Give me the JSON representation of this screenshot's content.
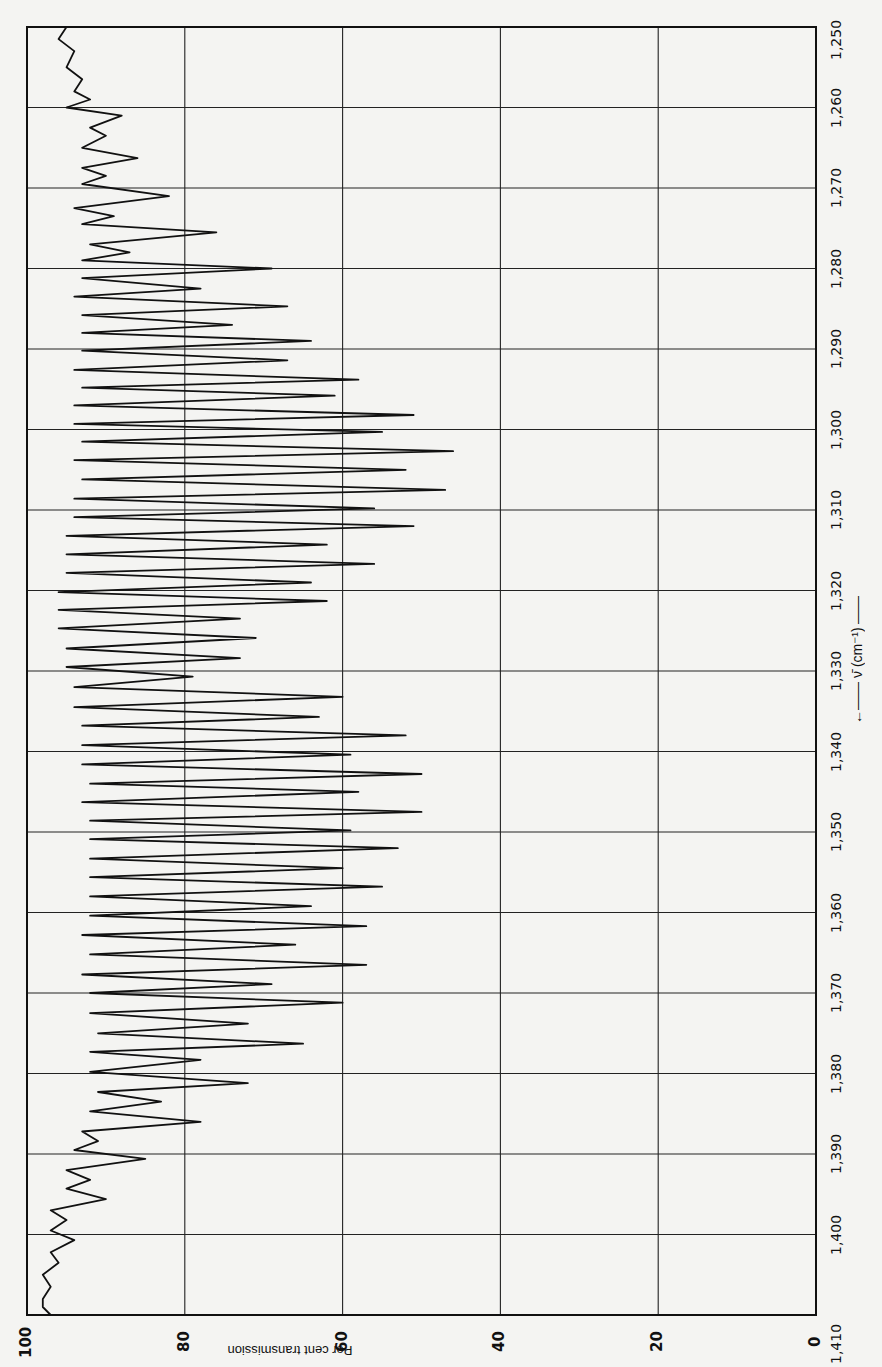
{
  "chart_data": {
    "type": "line",
    "title": "",
    "orientation": "rotated 90° (wavenumber runs vertically, transmission horizontally)",
    "xlabel": "ν̄ (cm⁻¹)",
    "ylabel": "Per cent transmission",
    "x_axis": {
      "label": "ν̄ (cm⁻¹)",
      "range": [
        1410,
        1250
      ],
      "ticks": [
        "1,410",
        "1,400",
        "1,390",
        "1,380",
        "1,370",
        "1,360",
        "1,350",
        "1,340",
        "1,330",
        "1,320",
        "1,310",
        "1,300",
        "1,290",
        "1,280",
        "1,270",
        "1,260",
        "1,250"
      ],
      "direction_arrow": "←"
    },
    "y_axis": {
      "label": "Per cent transmission",
      "range": [
        0,
        100
      ],
      "ticks": [
        "100",
        "80",
        "60",
        "40",
        "20",
        "0"
      ]
    },
    "grid": true,
    "legend": null,
    "series": [
      {
        "name": "IR absorption spectrum (rotational-vibrational band)",
        "points": [
          [
            1250,
            95
          ],
          [
            1251.5,
            96
          ],
          [
            1253,
            94
          ],
          [
            1255,
            95
          ],
          [
            1256.5,
            93
          ],
          [
            1258,
            94
          ],
          [
            1259,
            92
          ],
          [
            1260,
            95
          ],
          [
            1261,
            88
          ],
          [
            1262.5,
            92
          ],
          [
            1263.5,
            90
          ],
          [
            1265,
            93
          ],
          [
            1266.3,
            86
          ],
          [
            1267.5,
            93
          ],
          [
            1268.5,
            90
          ],
          [
            1269.5,
            93
          ],
          [
            1271,
            82
          ],
          [
            1272.5,
            94
          ],
          [
            1273.5,
            89
          ],
          [
            1274.5,
            93
          ],
          [
            1275.5,
            76
          ],
          [
            1277,
            92
          ],
          [
            1278,
            87
          ],
          [
            1279,
            93
          ],
          [
            1280,
            69
          ],
          [
            1281.2,
            93
          ],
          [
            1282.5,
            78
          ],
          [
            1283.5,
            94
          ],
          [
            1284.7,
            67
          ],
          [
            1285.8,
            93
          ],
          [
            1287,
            74
          ],
          [
            1288,
            93
          ],
          [
            1289,
            64
          ],
          [
            1290.2,
            93
          ],
          [
            1291.4,
            67
          ],
          [
            1292.6,
            94
          ],
          [
            1293.8,
            58
          ],
          [
            1294.8,
            93
          ],
          [
            1295.8,
            61
          ],
          [
            1297,
            94
          ],
          [
            1298.2,
            51
          ],
          [
            1299.3,
            94
          ],
          [
            1300.3,
            55
          ],
          [
            1301.5,
            93
          ],
          [
            1302.7,
            46
          ],
          [
            1303.8,
            94
          ],
          [
            1305,
            52
          ],
          [
            1306.2,
            93
          ],
          [
            1307.5,
            47
          ],
          [
            1308.6,
            94
          ],
          [
            1309.8,
            56
          ],
          [
            1310.9,
            94
          ],
          [
            1312,
            51
          ],
          [
            1313.2,
            95
          ],
          [
            1314.3,
            62
          ],
          [
            1315.5,
            95
          ],
          [
            1316.7,
            56
          ],
          [
            1317.8,
            95
          ],
          [
            1319,
            64
          ],
          [
            1320.2,
            96
          ],
          [
            1321.3,
            62
          ],
          [
            1322.4,
            96
          ],
          [
            1323.5,
            73
          ],
          [
            1324.7,
            96
          ],
          [
            1325.9,
            71
          ],
          [
            1327.2,
            95
          ],
          [
            1328.4,
            73
          ],
          [
            1329.5,
            95
          ],
          [
            1330.7,
            79
          ],
          [
            1332,
            94
          ],
          [
            1333.2,
            60
          ],
          [
            1334.5,
            94
          ],
          [
            1335.7,
            63
          ],
          [
            1336.8,
            93
          ],
          [
            1338,
            52
          ],
          [
            1339.2,
            93
          ],
          [
            1340.4,
            59
          ],
          [
            1341.6,
            93
          ],
          [
            1342.8,
            50
          ],
          [
            1344,
            92
          ],
          [
            1345,
            58
          ],
          [
            1346.3,
            93
          ],
          [
            1347.5,
            50
          ],
          [
            1348.6,
            92
          ],
          [
            1349.8,
            59
          ],
          [
            1350.9,
            92
          ],
          [
            1352,
            53
          ],
          [
            1353.3,
            92
          ],
          [
            1354.5,
            60
          ],
          [
            1355.6,
            92
          ],
          [
            1356.8,
            55
          ],
          [
            1358,
            92
          ],
          [
            1359.2,
            64
          ],
          [
            1360.4,
            92
          ],
          [
            1361.7,
            57
          ],
          [
            1362.8,
            93
          ],
          [
            1364,
            66
          ],
          [
            1365.2,
            92
          ],
          [
            1366.5,
            57
          ],
          [
            1367.7,
            93
          ],
          [
            1368.9,
            69
          ],
          [
            1370,
            92
          ],
          [
            1371.2,
            60
          ],
          [
            1372.5,
            92
          ],
          [
            1373.8,
            72
          ],
          [
            1375,
            91
          ],
          [
            1376.3,
            65
          ],
          [
            1377.3,
            92
          ],
          [
            1378.3,
            78
          ],
          [
            1379.8,
            92
          ],
          [
            1381.2,
            72
          ],
          [
            1382.3,
            91
          ],
          [
            1383.5,
            83
          ],
          [
            1384.7,
            92
          ],
          [
            1386,
            78
          ],
          [
            1387.2,
            93
          ],
          [
            1388.4,
            91
          ],
          [
            1389.5,
            94
          ],
          [
            1390.6,
            85
          ],
          [
            1392,
            95
          ],
          [
            1393.2,
            92
          ],
          [
            1394.3,
            95
          ],
          [
            1395.6,
            90
          ],
          [
            1397,
            97
          ],
          [
            1398.2,
            95
          ],
          [
            1399.5,
            97
          ],
          [
            1400.7,
            94
          ],
          [
            1402.2,
            97
          ],
          [
            1403.5,
            96
          ],
          [
            1405,
            98
          ],
          [
            1406.5,
            97
          ],
          [
            1408,
            98
          ],
          [
            1409,
            98
          ],
          [
            1410,
            97
          ]
        ]
      }
    ],
    "notable_minima_cm-1": {
      "deepest": {
        "wavenumber": 1302.7,
        "transmission": 46
      },
      "second": {
        "wavenumber": 1307.5,
        "transmission": 47
      },
      "gap_near": 1330
    }
  },
  "labels": {
    "ylabel": "Per cent transmission",
    "xlabel": "ν̄ (cm⁻¹)",
    "xlabel_arrow": "←——",
    "xlabel_tail": "——"
  }
}
